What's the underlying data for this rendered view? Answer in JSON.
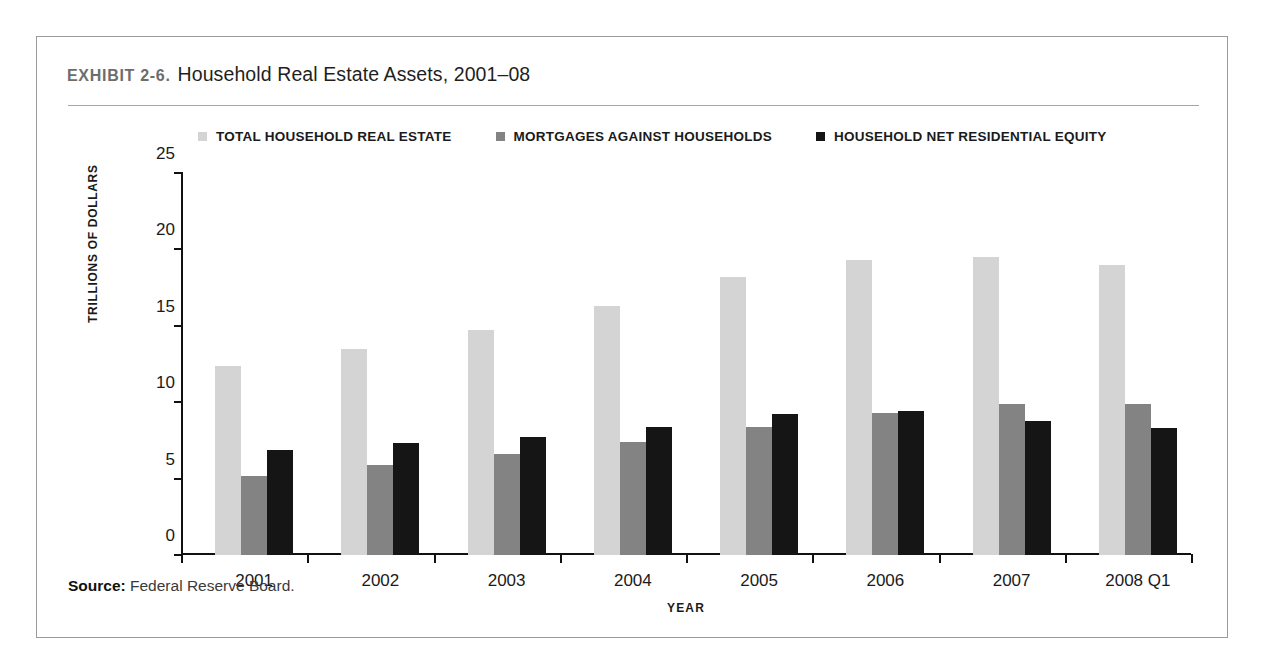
{
  "exhibit": {
    "label": "EXHIBIT 2-6.",
    "title": "Household Real Estate Assets, 2001–08",
    "source_label": "Source:",
    "source_text": "Federal Reserve Board."
  },
  "colors": {
    "series_total": "#d4d4d4",
    "series_mortgages": "#838383",
    "series_equity": "#151515",
    "axis": "#111111",
    "frame": "#9b9b9b",
    "rule": "#a6a6a6"
  },
  "chart_data": {
    "type": "bar",
    "title": "Household Real Estate Assets, 2001–08",
    "xlabel": "YEAR",
    "ylabel": "TRILLIONS OF DOLLARS",
    "categories": [
      "2001",
      "2002",
      "2003",
      "2004",
      "2005",
      "2006",
      "2007",
      "2008 Q1"
    ],
    "series": [
      {
        "name": "TOTAL HOUSEHOLD REAL ESTATE",
        "color": "#d4d4d4",
        "values": [
          12.4,
          13.5,
          14.7,
          16.3,
          18.2,
          19.3,
          19.5,
          19.0
        ]
      },
      {
        "name": "MORTGAGES AGAINST HOUSEHOLDS",
        "color": "#838383",
        "values": [
          5.2,
          5.9,
          6.6,
          7.4,
          8.4,
          9.3,
          9.9,
          9.9
        ]
      },
      {
        "name": "HOUSEHOLD NET RESIDENTIAL EQUITY",
        "color": "#151515",
        "values": [
          6.9,
          7.3,
          7.7,
          8.4,
          9.2,
          9.4,
          8.8,
          8.3
        ]
      }
    ],
    "ylim": [
      0,
      25
    ],
    "yticks": [
      0,
      5,
      10,
      15,
      20,
      25
    ],
    "ytick_labels": [
      "0",
      "5",
      "10",
      "15",
      "20",
      "25"
    ],
    "grid": false,
    "legend_position": "top"
  }
}
